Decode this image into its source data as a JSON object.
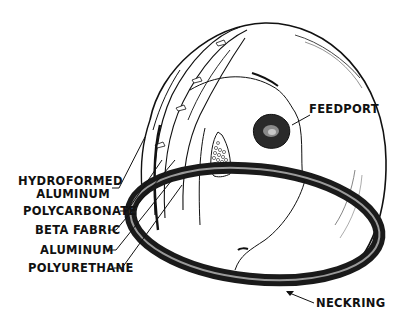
{
  "diagram": {
    "colors": {
      "ink": "#111111",
      "background": "#ffffff",
      "ring": "#2a2a2a",
      "ring_highlight": "#9a9a9a"
    },
    "labels": {
      "hydroformed_line1": "HYDROFORMED",
      "hydroformed_line2": "ALUMINUM",
      "polycarbonate": "POLYCARBONATE",
      "beta_fabric": "BETA FABRIC",
      "aluminum": "ALUMINUM",
      "polyurethane": "POLYURETHANE",
      "feedport": "FEEDPORT",
      "neckring": "NECKRING"
    }
  }
}
